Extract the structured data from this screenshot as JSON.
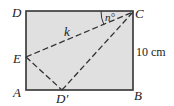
{
  "diagram": {
    "fill_color": "#e0e0e0",
    "stroke_color": "#333333",
    "points": {
      "A": {
        "label": "A"
      },
      "B": {
        "label": "B"
      },
      "C": {
        "label": "C"
      },
      "D": {
        "label": "D"
      },
      "E": {
        "label": "E"
      },
      "D_prime": {
        "label": "D′"
      }
    },
    "labels": {
      "angle": "n°",
      "segment_k": "k",
      "side_length": "10 cm"
    }
  }
}
